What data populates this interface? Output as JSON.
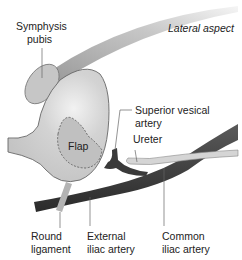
{
  "diagram": {
    "view_label": "Lateral aspect",
    "structures": {
      "flap": "Flap"
    },
    "labels": {
      "symphysis_pubis": [
        "Symphysis",
        "pubis"
      ],
      "superior_vesical_artery": [
        "Superior vesical",
        "artery"
      ],
      "ureter": [
        "Ureter"
      ],
      "round_ligament": [
        "Round",
        "ligament"
      ],
      "external_iliac_artery": [
        "External",
        "iliac artery"
      ],
      "common_iliac_artery": [
        "Common",
        "iliac artery"
      ]
    },
    "colors": {
      "bladder_fill": "#c9c9c9",
      "bladder_highlight": "#ececec",
      "outline": "#555555",
      "artery": "#3d3d3d",
      "ureter": "#d4d4d4",
      "pubis": "#c4c4c4",
      "ligament": "#b5b5b5",
      "leader": "#666666"
    }
  }
}
